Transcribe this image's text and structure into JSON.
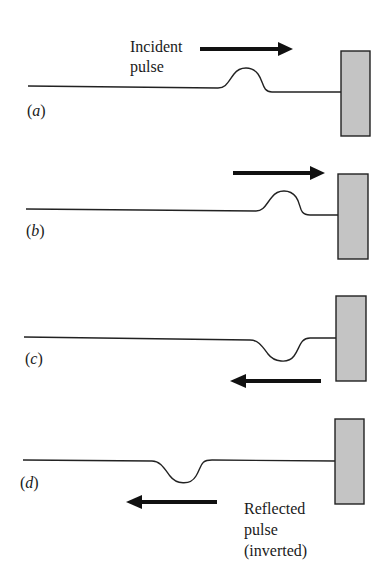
{
  "figure": {
    "panels": [
      {
        "id": "a",
        "label_open": "(",
        "label_letter": "a",
        "label_close": ")",
        "annotation_lines": [
          "Incident",
          "pulse"
        ],
        "arrow_direction": "right",
        "pulse": "upright"
      },
      {
        "id": "b",
        "label_open": "(",
        "label_letter": "b",
        "label_close": ")",
        "annotation_lines": [],
        "arrow_direction": "right",
        "pulse": "upright"
      },
      {
        "id": "c",
        "label_open": "(",
        "label_letter": "c",
        "label_close": ")",
        "annotation_lines": [],
        "arrow_direction": "left",
        "pulse": "inverted"
      },
      {
        "id": "d",
        "label_open": "(",
        "label_letter": "d",
        "label_close": ")",
        "annotation_lines": [
          "Reflected",
          "pulse",
          "(inverted)"
        ],
        "arrow_direction": "left",
        "pulse": "inverted"
      }
    ]
  },
  "colors": {
    "wall_fill": "#c4c4c4",
    "line": "#222222",
    "arrow": "#111111",
    "background": "#ffffff"
  }
}
